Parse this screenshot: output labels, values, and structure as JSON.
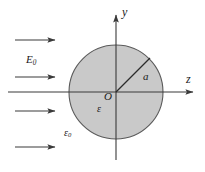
{
  "figure": {
    "background_color": "#ffffff",
    "sphere": {
      "fill_color": "#c9c9c9",
      "stroke_color": "#4a4a4a",
      "center_x": 116,
      "center_y": 92,
      "radius": 47
    },
    "axes": {
      "line_color": "#3a3a3a",
      "vertical": {
        "label": "y",
        "x": 116,
        "y_top": 12,
        "y_bottom": 160
      },
      "horizontal": {
        "label": "z",
        "y": 92,
        "x_left": 8,
        "x_right": 196
      }
    },
    "radius_line": {
      "label": "a",
      "from_x": 116,
      "from_y": 92,
      "to_x": 150,
      "to_y": 58,
      "color": "#2b2b2b"
    },
    "origin_label": "O",
    "permittivity_inside_label": "ε",
    "permittivity_outside_label": "ε",
    "permittivity_outside_subscript": "0",
    "field_label": "E",
    "field_subscript": "0",
    "field_arrows": [
      {
        "x_start": 15,
        "x_end": 57,
        "y": 40
      },
      {
        "x_start": 15,
        "x_end": 57,
        "y": 77
      },
      {
        "x_start": 15,
        "x_end": 57,
        "y": 111
      },
      {
        "x_start": 15,
        "x_end": 57,
        "y": 147
      }
    ],
    "arrow_color": "#3a3a3a"
  }
}
